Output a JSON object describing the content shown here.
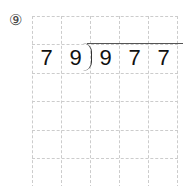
{
  "problem": {
    "number_label": "⑨",
    "divisor": [
      "7",
      "9"
    ],
    "dividend": [
      "9",
      "7",
      "7"
    ]
  },
  "grid": {
    "columns": 5,
    "rows": 6
  }
}
